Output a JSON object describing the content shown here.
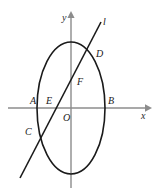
{
  "figure": {
    "background_color": "#ffffff",
    "width": 159,
    "height": 192
  },
  "axes": {
    "x_label": "x",
    "y_label": "y",
    "axis_color": "#8c8c8c",
    "origin_label": "O",
    "x_axis": {
      "y": 108,
      "x_start": 8,
      "x_end": 148,
      "arrow": true
    },
    "y_axis": {
      "x": 71,
      "y_start": 12,
      "y_end": 188,
      "arrow": true
    }
  },
  "curve": {
    "type": "ellipse",
    "stroke_color": "#1a1a1a",
    "center_x": 71,
    "center_y": 108,
    "radius_x": 34,
    "radius_y": 66
  },
  "line": {
    "name": "l",
    "label": "l",
    "stroke_color": "#1a1a1a",
    "x1": 20,
    "y1": 178,
    "x2": 101,
    "y2": 22
  },
  "points": [
    {
      "id": "A",
      "label": "A",
      "x": 30,
      "y": 101
    },
    {
      "id": "E",
      "label": "E",
      "x": 46,
      "y": 101
    },
    {
      "id": "O",
      "label": "O",
      "x": 63,
      "y": 118
    },
    {
      "id": "B",
      "label": "B",
      "x": 108,
      "y": 101
    },
    {
      "id": "C",
      "label": "C",
      "x": 25,
      "y": 132
    },
    {
      "id": "D",
      "label": "D",
      "x": 96,
      "y": 54
    },
    {
      "id": "F",
      "label": "F",
      "x": 77,
      "y": 82
    }
  ],
  "labels": {
    "x_axis_label_pos": {
      "x": 141,
      "y": 115
    },
    "y_axis_label_pos": {
      "x": 62,
      "y": 18
    },
    "line_label_pos": {
      "x": 103,
      "y": 22
    }
  }
}
